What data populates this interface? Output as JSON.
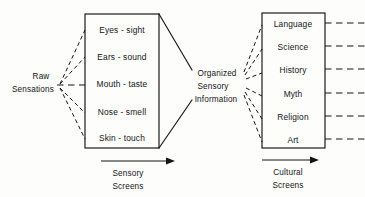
{
  "diagram": {
    "source_label": {
      "line1": "Raw",
      "line2": "Sensations"
    },
    "middle_label": {
      "line1": "Organized",
      "line2": "Sensory",
      "line3": "Information"
    },
    "sensory_box": {
      "name": "sensory-screens-box",
      "rows": [
        "Eyes - sight",
        "Ears - sound",
        "Mouth - taste",
        "Nose - smell",
        "Skin - touch"
      ]
    },
    "cultural_box": {
      "name": "cultural-screens-box",
      "rows": [
        "Language",
        "Science",
        "History",
        "Myth",
        "Religion",
        "Art"
      ]
    },
    "arrows": [
      {
        "id": "sensory-screens-arrow",
        "line1": "Sensory",
        "line2": "Screens"
      },
      {
        "id": "cultural-screens-arrow",
        "line1": "Cultural",
        "line2": "Screens"
      }
    ],
    "colors": {
      "ink": "#141414",
      "background": "#fdfdfc"
    }
  }
}
